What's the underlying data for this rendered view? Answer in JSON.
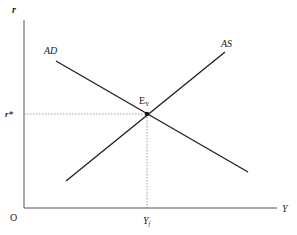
{
  "diagram": {
    "type": "AD-AS equilibrium",
    "axes": {
      "y_label": "r",
      "x_label": "Y",
      "origin_label": "O"
    },
    "curves": [
      {
        "name": "AD",
        "label": "AD",
        "from": [
          56,
          61
        ],
        "to": [
          248,
          172
        ]
      },
      {
        "name": "AS",
        "label": "AS",
        "from": [
          66,
          181
        ],
        "to": [
          225,
          52
        ]
      }
    ],
    "equilibrium": {
      "label_main": "E",
      "label_sub": "Y",
      "point": [
        147,
        114
      ]
    },
    "guides": {
      "r_star_label": "r*",
      "y_f_label_main": "Y",
      "y_f_label_sub": "f"
    },
    "colors": {
      "line": "#222222",
      "guide": "#888888"
    }
  }
}
